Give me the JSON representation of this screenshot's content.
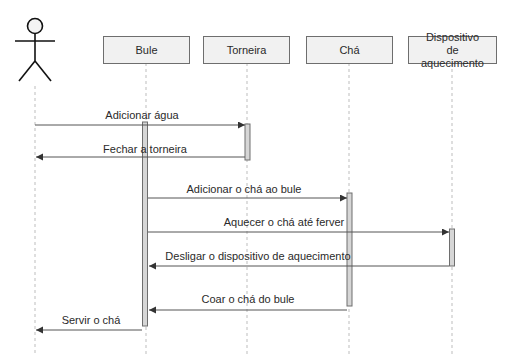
{
  "diagram": {
    "type": "sequence",
    "actor": {
      "name": "",
      "x": 35
    },
    "participants": [
      {
        "id": "bule",
        "label": "Bule",
        "x": 146,
        "box_left": 103,
        "box_width": 87
      },
      {
        "id": "torneira",
        "label": "Torneira",
        "x": 247,
        "box_left": 203,
        "box_width": 87
      },
      {
        "id": "cha",
        "label": "Chá",
        "x": 349,
        "box_left": 306,
        "box_width": 87
      },
      {
        "id": "dispositivo",
        "label": "Dispositivo de aquecimento",
        "x": 452,
        "box_left": 408,
        "box_width": 89
      }
    ],
    "messages": [
      {
        "label": "Adicionar água",
        "from": "actor",
        "to": "torneira",
        "y": 125
      },
      {
        "label": "Fechar a torneira",
        "from": "torneira",
        "to": "actor",
        "y": 157
      },
      {
        "label": "Adicionar o chá ao bule",
        "from": "bule",
        "to": "cha",
        "y": 198
      },
      {
        "label": "Aquecer o chá até ferver",
        "from": "bule",
        "to": "dispositivo",
        "y": 232
      },
      {
        "label": "Desligar o dispositivo de aquecimento",
        "from": "dispositivo",
        "to": "bule",
        "y": 266
      },
      {
        "label": "Coar o chá do bule",
        "from": "cha",
        "to": "bule",
        "y": 310
      },
      {
        "label": "Servir o chá",
        "from": "bule",
        "to": "actor",
        "y": 330
      }
    ],
    "colors": {
      "line": "#6e6e6e",
      "box_fill": "#f1f1f1",
      "activation_fill": "#d4d4d4",
      "lifeline": "#b8b8b8",
      "text": "#2a2a2a"
    }
  }
}
